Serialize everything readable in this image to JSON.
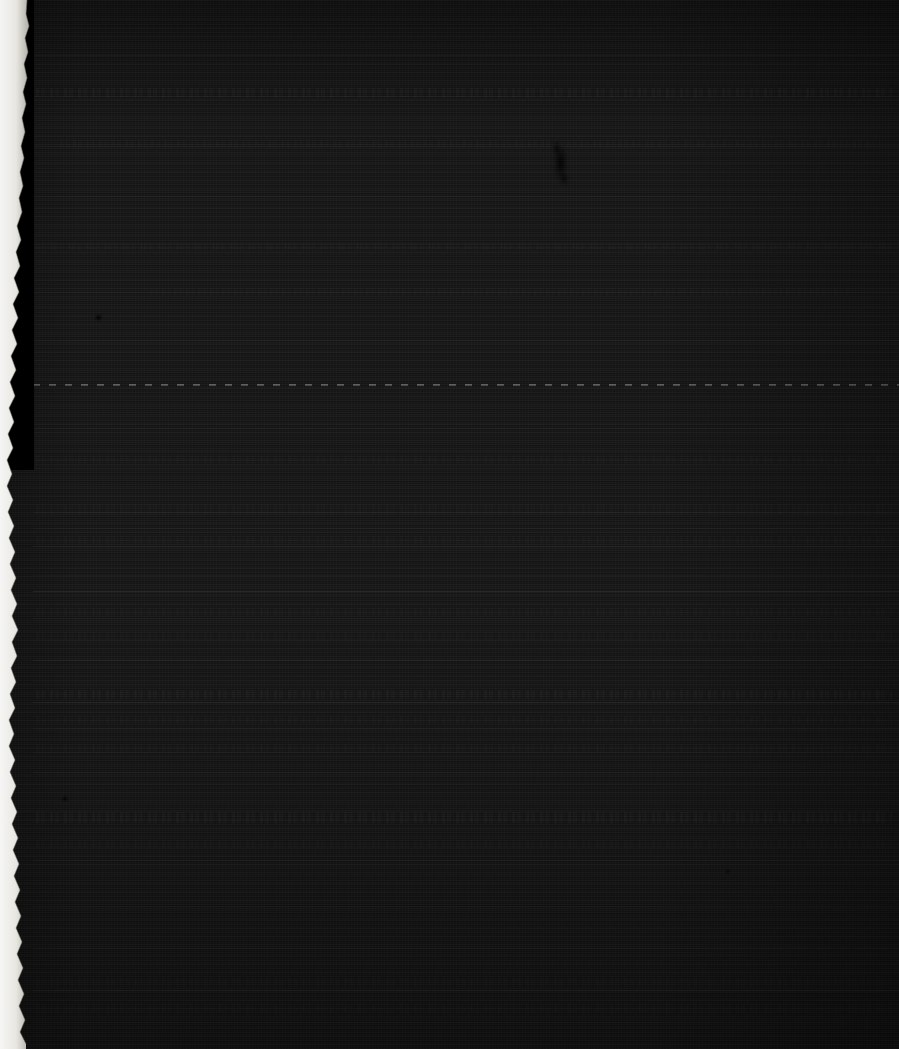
{
  "image": {
    "kind": "underexposed-document-photo",
    "width": 899,
    "height": 1049,
    "caption": "Severely underexposed photograph of a ruled paper document",
    "legibility": "no text is legible at this exposure"
  },
  "colors": {
    "page_base": "#191919",
    "page_shadow": "#0d0d0d",
    "outer_black": "#000000",
    "torn_paper_white": "#f2f1ec",
    "rule_light": "#4a4a4a",
    "ink_mark": "#050505"
  },
  "page": {
    "surface_label": "document page surface",
    "texture": "horizontal scanline grain"
  },
  "torn_edge": {
    "label": "torn paper edge",
    "side": "left",
    "description": "ragged light paper edge running top to bottom, narrow at the top and widening toward the bottom"
  },
  "outer_region": {
    "label": "black background beyond page edge",
    "description": "pure black area at the upper left, outside the torn paper edge"
  },
  "marks": {
    "smudge_label": "ink smudge mark",
    "speck_label": "dust speck"
  },
  "rules": [
    {
      "name": "rule-1",
      "y": 55,
      "style": "faint",
      "x": 33,
      "w": 866
    },
    {
      "name": "rule-2",
      "y": 96,
      "style": "faint",
      "x": 33,
      "w": 866
    },
    {
      "name": "rule-3",
      "y": 146,
      "style": "faint",
      "x": 33,
      "w": 866
    },
    {
      "name": "rule-4",
      "y": 196,
      "style": "faint",
      "x": 33,
      "w": 866
    },
    {
      "name": "rule-5",
      "y": 247,
      "style": "faint",
      "x": 33,
      "w": 866
    },
    {
      "name": "rule-6",
      "y": 292,
      "style": "faint",
      "x": 33,
      "w": 866
    },
    {
      "name": "rule-7",
      "y": 340,
      "style": "faint",
      "x": 33,
      "w": 866
    },
    {
      "name": "perforation-rule",
      "y": 384,
      "style": "dashed",
      "x": 33,
      "w": 866
    },
    {
      "name": "rule-8",
      "y": 428,
      "style": "faint",
      "x": 33,
      "w": 866
    },
    {
      "name": "rule-9",
      "y": 465,
      "style": "faint",
      "x": 33,
      "w": 866
    },
    {
      "name": "rule-10",
      "y": 512,
      "style": "faint",
      "x": 33,
      "w": 866
    },
    {
      "name": "rule-11",
      "y": 528,
      "style": "faint",
      "x": 33,
      "w": 866
    },
    {
      "name": "rule-12",
      "y": 546,
      "style": "solid",
      "x": 33,
      "w": 866
    },
    {
      "name": "rule-13",
      "y": 575,
      "style": "faint",
      "x": 33,
      "w": 866
    },
    {
      "name": "section-rule-a",
      "y": 591,
      "style": "strong",
      "x": 33,
      "w": 866
    },
    {
      "name": "rule-14",
      "y": 618,
      "style": "faint",
      "x": 33,
      "w": 866
    },
    {
      "name": "rule-15",
      "y": 641,
      "style": "faint",
      "x": 33,
      "w": 866
    },
    {
      "name": "section-rule-b",
      "y": 660,
      "style": "solid",
      "x": 33,
      "w": 866
    },
    {
      "name": "rule-16",
      "y": 681,
      "style": "faint",
      "x": 33,
      "w": 866
    },
    {
      "name": "section-rule-c",
      "y": 702,
      "style": "solid",
      "x": 33,
      "w": 866
    },
    {
      "name": "rule-17",
      "y": 728,
      "style": "faint",
      "x": 33,
      "w": 866
    },
    {
      "name": "rule-18",
      "y": 752,
      "style": "faint",
      "x": 33,
      "w": 866
    },
    {
      "name": "rule-19",
      "y": 772,
      "style": "faint",
      "x": 33,
      "w": 866
    },
    {
      "name": "rule-20",
      "y": 860,
      "style": "faint",
      "x": 33,
      "w": 866
    },
    {
      "name": "rule-21",
      "y": 906,
      "style": "faint",
      "x": 33,
      "w": 866
    },
    {
      "name": "rule-22",
      "y": 948,
      "style": "faint",
      "x": 33,
      "w": 866
    },
    {
      "name": "rule-23",
      "y": 990,
      "style": "solid",
      "x": 33,
      "w": 866
    },
    {
      "name": "rule-24",
      "y": 1022,
      "style": "faint",
      "x": 33,
      "w": 866
    }
  ],
  "text_bands": [
    {
      "name": "text-band-1",
      "x": 36,
      "y": 88,
      "w": 856,
      "h": 9,
      "dim": false
    },
    {
      "name": "text-band-2",
      "x": 60,
      "y": 140,
      "w": 820,
      "h": 7,
      "dim": true
    },
    {
      "name": "text-band-3",
      "x": 36,
      "y": 243,
      "w": 860,
      "h": 7,
      "dim": true
    },
    {
      "name": "text-band-4",
      "x": 150,
      "y": 290,
      "w": 700,
      "h": 6,
      "dim": true
    },
    {
      "name": "text-band-5",
      "x": 36,
      "y": 455,
      "w": 856,
      "h": 8,
      "dim": true
    },
    {
      "name": "text-band-6",
      "x": 36,
      "y": 505,
      "w": 856,
      "h": 9,
      "dim": true
    },
    {
      "name": "text-band-7",
      "x": 36,
      "y": 536,
      "w": 856,
      "h": 9,
      "dim": true
    },
    {
      "name": "text-band-8",
      "x": 36,
      "y": 608,
      "w": 856,
      "h": 8,
      "dim": true
    },
    {
      "name": "text-band-9",
      "x": 36,
      "y": 632,
      "w": 856,
      "h": 8,
      "dim": true
    },
    {
      "name": "text-band-10",
      "x": 36,
      "y": 690,
      "w": 856,
      "h": 9,
      "dim": false
    },
    {
      "name": "text-band-11",
      "x": 36,
      "y": 716,
      "w": 856,
      "h": 8,
      "dim": true
    },
    {
      "name": "text-band-12",
      "x": 36,
      "y": 744,
      "w": 856,
      "h": 8,
      "dim": true
    },
    {
      "name": "text-band-13",
      "x": 36,
      "y": 812,
      "w": 856,
      "h": 11,
      "dim": false
    },
    {
      "name": "text-band-14",
      "x": 36,
      "y": 840,
      "w": 856,
      "h": 8,
      "dim": true
    },
    {
      "name": "text-band-15",
      "x": 36,
      "y": 978,
      "w": 856,
      "h": 9,
      "dim": true
    },
    {
      "name": "text-band-16",
      "x": 36,
      "y": 1004,
      "w": 856,
      "h": 9,
      "dim": true
    }
  ],
  "specks": [
    {
      "name": "dust-speck-1",
      "x": 96,
      "y": 315,
      "size": 5
    },
    {
      "name": "dust-speck-2",
      "x": 63,
      "y": 797,
      "size": 4
    },
    {
      "name": "dust-speck-3",
      "x": 726,
      "y": 870,
      "size": 3
    }
  ],
  "smudge": {
    "name": "ink-smudge",
    "x": 543,
    "y": 133,
    "w": 34,
    "h": 62
  }
}
